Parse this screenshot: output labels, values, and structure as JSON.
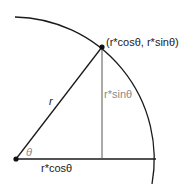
{
  "diagram": {
    "title": "",
    "colors": {
      "stroke": "#1a1a1a",
      "sine_line": "#555555",
      "sine_label": "#8a8a8a"
    },
    "points": [
      {
        "id": "origin",
        "x": 16,
        "y": 159
      },
      {
        "id": "point-on-circle",
        "x": 102,
        "y": 47
      }
    ],
    "arc": {
      "center": [
        16,
        159
      ],
      "radius": 142
    },
    "labels": {
      "point": "(r*cosθ, r*sinθ)",
      "radius": "r",
      "sine": "r*sinθ",
      "cosine": "r*cosθ",
      "angle": "θ"
    }
  }
}
